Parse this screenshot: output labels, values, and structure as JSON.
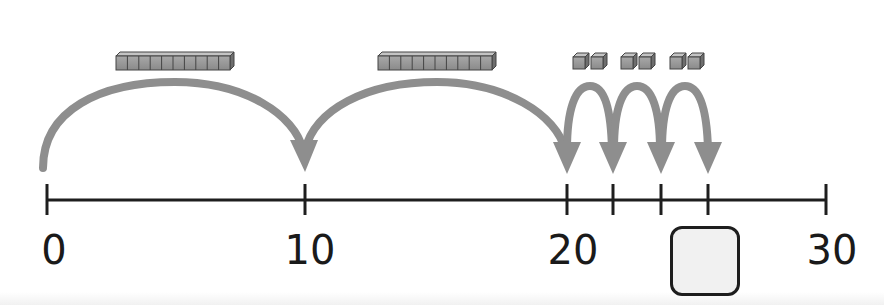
{
  "number_line": {
    "start": 0,
    "end": 30,
    "labels": [
      {
        "value": 0,
        "text": "0"
      },
      {
        "value": 10,
        "text": "10"
      },
      {
        "value": 20,
        "text": "20"
      },
      {
        "value": 30,
        "text": "30"
      }
    ],
    "ticks": [
      0,
      10,
      20,
      22,
      24,
      26,
      30
    ]
  },
  "jumps": [
    {
      "from": 0,
      "to": 10,
      "blocks": "ten-rod",
      "count": 10
    },
    {
      "from": 10,
      "to": 20,
      "blocks": "ten-rod",
      "count": 10
    },
    {
      "from": 20,
      "to": 22,
      "blocks": "unit-cubes",
      "count": 2
    },
    {
      "from": 22,
      "to": 24,
      "blocks": "unit-cubes",
      "count": 2
    },
    {
      "from": 24,
      "to": 26,
      "blocks": "unit-cubes",
      "count": 2
    }
  ],
  "answer_box": {
    "value": "",
    "position": 26
  },
  "colors": {
    "arrow": "#8e8e8e",
    "line": "#1e1e1e",
    "block": "#9a9a9a"
  }
}
